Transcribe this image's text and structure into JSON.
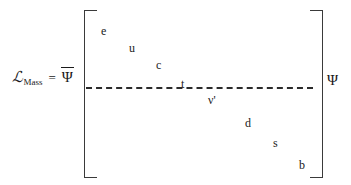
{
  "equation": {
    "lagrangian_symbol": "ℒ",
    "lagrangian_subscript": "Mass",
    "equals_sign": "=",
    "psi_bar": "Ψ",
    "psi": "Ψ"
  },
  "matrix": {
    "upper_particles": [
      {
        "name": "electron",
        "label": "e",
        "x": 101,
        "y": 25
      },
      {
        "name": "up-quark",
        "label": "u",
        "x": 129,
        "y": 42
      },
      {
        "name": "charm-quark",
        "label": "c",
        "x": 156,
        "y": 59
      }
    ],
    "on_line_particles": [
      {
        "name": "top-quark",
        "label": "t",
        "x": 181,
        "y": 78
      }
    ],
    "lower_particles": [
      {
        "name": "neutrino-prime",
        "label": "ν'",
        "x": 208,
        "y": 94
      },
      {
        "name": "down-quark",
        "label": "d",
        "x": 245,
        "y": 117
      },
      {
        "name": "strange-quark",
        "label": "s",
        "x": 273,
        "y": 137
      },
      {
        "name": "bottom-quark",
        "label": "b",
        "x": 299,
        "y": 159
      }
    ]
  },
  "style": {
    "ink_color": "#1a1a1a",
    "bracket_color": "#3a3a3a",
    "background_color": "#ffffff"
  }
}
